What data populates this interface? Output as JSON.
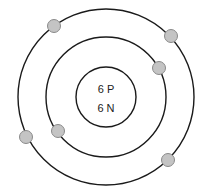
{
  "diagram": {
    "type": "bohr-atom-model",
    "element": "carbon",
    "nucleus": {
      "protons_label": "6 P",
      "neutrons_label": "6 N",
      "center": [
        106,
        97
      ],
      "radius": 30
    },
    "shells": [
      {
        "name": "inner-shell",
        "radius": 60,
        "electrons": 2
      },
      {
        "name": "outer-shell",
        "radius": 88,
        "electrons": 4
      }
    ],
    "electrons": [
      {
        "shell": 1,
        "x": 159,
        "y": 68
      },
      {
        "shell": 1,
        "x": 58,
        "y": 131
      },
      {
        "shell": 2,
        "x": 54,
        "y": 26
      },
      {
        "shell": 2,
        "x": 171,
        "y": 36
      },
      {
        "shell": 2,
        "x": 26,
        "y": 137
      },
      {
        "shell": 2,
        "x": 168,
        "y": 160
      }
    ],
    "colors": {
      "orbit": "#1a1a1a",
      "electron_fill": "#c4c4c4",
      "electron_stroke": "#8a8a8a",
      "background": "#ffffff"
    }
  }
}
